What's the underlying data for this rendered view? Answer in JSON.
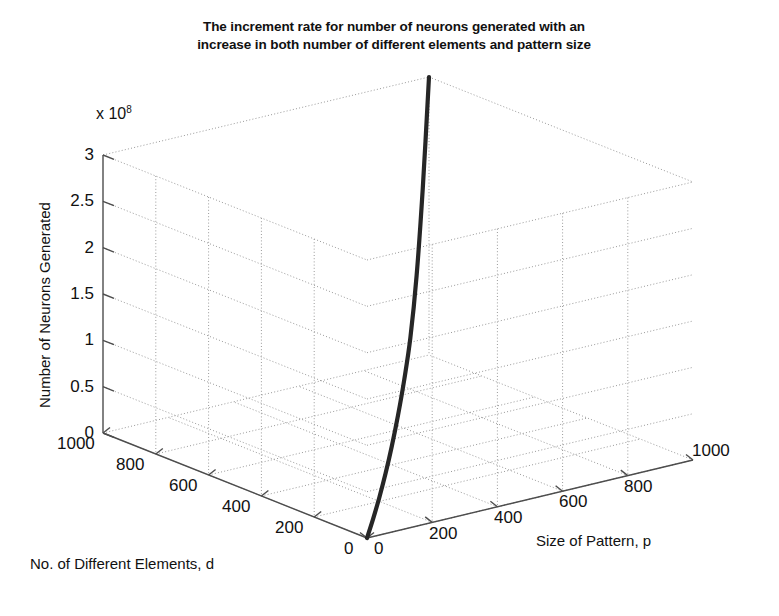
{
  "figure": {
    "title_lines": [
      "The increment rate for number of neurons generated with an",
      "increase in both number of different elements and pattern size"
    ],
    "background": "#ffffff",
    "line_color": "#262626",
    "grid_color": "#9a9a9a",
    "axis_color": "#4d4d4d"
  },
  "chart_data": {
    "type": "line",
    "projection": "3d",
    "title": "The increment rate for number of neurons generated with an increase in both number of different elements and pattern size",
    "xlabel": "Size of Pattern, p",
    "ylabel": "No. of Different Elements, d",
    "zlabel": "Number of Neurons Generated",
    "z_exponent_mantissa": "x 10",
    "z_exponent_power": "8",
    "grid": true,
    "legend": "none",
    "xlim": [
      0,
      1000
    ],
    "ylim": [
      0,
      1000
    ],
    "zlim": [
      0,
      3
    ],
    "xticks": [
      0,
      200,
      400,
      600,
      800,
      1000
    ],
    "yticks": [
      0,
      200,
      400,
      600,
      800,
      1000
    ],
    "zticks": [
      0,
      0.5,
      1,
      1.5,
      2,
      2.5,
      3
    ],
    "xticklabels": [
      "0",
      "200",
      "400",
      "600",
      "800",
      "1000"
    ],
    "yticklabels": [
      "0",
      "200",
      "400",
      "600",
      "800",
      "1000"
    ],
    "zticklabels": [
      "0",
      "0.5",
      "1",
      "1.5",
      "2",
      "2.5",
      "3"
    ],
    "series": [
      {
        "name": "neurons generated",
        "x": [
          0,
          100,
          200,
          300,
          400,
          500,
          600,
          700,
          800,
          900,
          1000
        ],
        "y": [
          0,
          100,
          200,
          300,
          400,
          500,
          600,
          700,
          800,
          900,
          1000
        ],
        "z": [
          0,
          0.012,
          0.045,
          0.105,
          0.2,
          0.335,
          0.52,
          0.78,
          1.25,
          2.0,
          3.0
        ]
      }
    ]
  },
  "ticks": {
    "z": [
      "3",
      "2.5",
      "2",
      "1.5",
      "1",
      "0.5",
      "0"
    ],
    "d": [
      "1000",
      "800",
      "600",
      "400",
      "200",
      "0"
    ],
    "p": [
      "0",
      "200",
      "400",
      "600",
      "800",
      "1000"
    ]
  },
  "labels": {
    "z_axis": "Number of Neurons Generated",
    "d_axis": "No. of Different Elements, d",
    "p_axis": "Size of Pattern, p",
    "exponent_prefix": "x 10",
    "exponent_power": "8"
  }
}
